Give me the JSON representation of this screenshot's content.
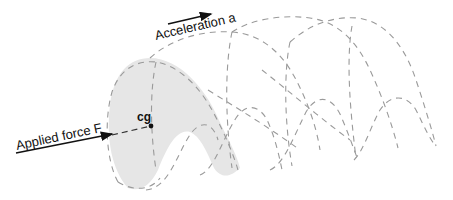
{
  "diagram": {
    "labels": {
      "acceleration": "Acceleration a",
      "applied_force": "Applied force F",
      "center_of_gravity": "cg"
    },
    "colors": {
      "shade": "#e6e6e6",
      "dashed_line": "#9a9a9a",
      "arrow": "#111111",
      "text": "#111111",
      "background": "#ffffff"
    },
    "elements": {
      "acceleration_arrow": "arrow pointing right (direction of motion)",
      "force_arrow": "arrow pointing right toward cg",
      "cg_point": "filled dot",
      "shaded_cross_section": "grey shaded wave-shaped body section",
      "dashed_wave_loops": "successive dashed outlines of wave body"
    }
  }
}
